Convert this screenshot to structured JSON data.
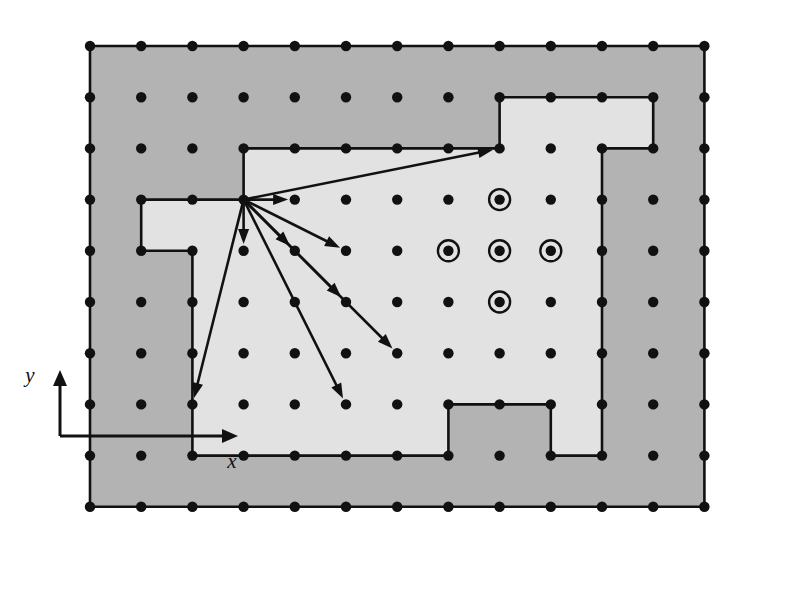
{
  "figure": {
    "name": "finite-difference-grid-domain-diagram",
    "width": 786,
    "height": 603,
    "background_color": "#ffffff"
  },
  "axes": {
    "x_label": "x",
    "y_label": "y",
    "origin": {
      "x": 60,
      "y": 436
    },
    "x_arrow_end": {
      "x": 238,
      "y": 436
    },
    "y_arrow_end": {
      "x": 60,
      "y": 370
    },
    "x_label_pos": {
      "x": 232,
      "y": 468
    },
    "y_label_pos": {
      "x": 30,
      "y": 382
    },
    "color": "#111111",
    "line_width": 3
  },
  "grid": {
    "origin": {
      "x": 90,
      "y": 46
    },
    "spacing_x": 51.2,
    "spacing_y": 51.2,
    "cols": 13,
    "rows": 10,
    "node_radius": 5.2,
    "node_color": "#111111"
  },
  "regions": {
    "outer": {
      "label": "exterior-region",
      "fill": "#b3b3b3",
      "stroke": "#111111",
      "stroke_width": 2.6,
      "polygon_cells": [
        [
          0,
          0
        ],
        [
          12,
          0
        ],
        [
          12,
          9
        ],
        [
          0,
          9
        ]
      ]
    },
    "inner": {
      "label": "interior-region",
      "fill": "#e2e2e2",
      "stroke": "#111111",
      "stroke_width": 2.6,
      "polygon_cells": [
        [
          3,
          3
        ],
        [
          3,
          2
        ],
        [
          8,
          2
        ],
        [
          8,
          1
        ],
        [
          11,
          1
        ],
        [
          11,
          2
        ],
        [
          10,
          2
        ],
        [
          10,
          8
        ],
        [
          9,
          8
        ],
        [
          9,
          7
        ],
        [
          7,
          7
        ],
        [
          7,
          8
        ],
        [
          2,
          8
        ],
        [
          2,
          4
        ],
        [
          1,
          4
        ],
        [
          1,
          3
        ]
      ]
    }
  },
  "source_node": {
    "label": "arrow-source-node",
    "cell": [
      3,
      3
    ]
  },
  "arrows": {
    "label": "stencil-connection-arrows",
    "color": "#111111",
    "line_width": 2.6,
    "head_length": 15,
    "head_width": 11,
    "targets": [
      {
        "cell": [
          4,
          3
        ]
      },
      {
        "cell": [
          8,
          2
        ]
      },
      {
        "cell": [
          3,
          4
        ]
      },
      {
        "cell": [
          4,
          4
        ]
      },
      {
        "cell": [
          5,
          4
        ]
      },
      {
        "cell": [
          5,
          5
        ]
      },
      {
        "cell": [
          6,
          6
        ]
      },
      {
        "cell": [
          5,
          7
        ]
      },
      {
        "cell": [
          2,
          7
        ]
      }
    ]
  },
  "circled_nodes": {
    "label": "five-point-stencil",
    "outer_radius": 10.5,
    "inner_radius": 4.6,
    "ring_width": 2.4,
    "color": "#111111",
    "center_cell": [
      8,
      4
    ],
    "cells": [
      [
        8,
        3
      ],
      [
        7,
        4
      ],
      [
        8,
        4
      ],
      [
        9,
        4
      ],
      [
        8,
        5
      ]
    ]
  }
}
